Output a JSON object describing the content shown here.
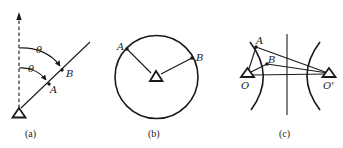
{
  "figure": {
    "panels": [
      {
        "id": "a",
        "caption": "(a)",
        "points": [
          {
            "label": "A"
          },
          {
            "label": "B"
          }
        ],
        "angles": [
          {
            "label": "θ"
          },
          {
            "label": "θ"
          }
        ],
        "elements": [
          "station-triangle",
          "dashed-reference-arrow",
          "ray",
          "angle-arcs"
        ]
      },
      {
        "id": "b",
        "caption": "(b)",
        "points": [
          {
            "label": "A"
          },
          {
            "label": "B"
          }
        ],
        "elements": [
          "station-triangle",
          "circle",
          "radii"
        ]
      },
      {
        "id": "c",
        "caption": "(c)",
        "points": [
          {
            "label": "A"
          },
          {
            "label": "B"
          }
        ],
        "stations": [
          {
            "label": "O"
          },
          {
            "label": "O'"
          }
        ],
        "elements": [
          "two-station-triangles",
          "hyperbola-branches",
          "perpendicular-bisector",
          "connecting-lines"
        ]
      }
    ],
    "colors": {
      "stroke": "#1a1a1a",
      "background": "#ffffff"
    }
  }
}
